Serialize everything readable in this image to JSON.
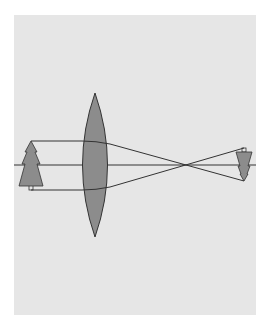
{
  "diagram": {
    "type": "converging-lens-ray-diagram",
    "colors": {
      "background": "#ffffff",
      "panel": "#e6e6e6",
      "lens_fill": "#8c8c8c",
      "object_fill": "#8c8c8c",
      "line": "#333333"
    },
    "elements": [
      {
        "name": "optical-axis"
      },
      {
        "name": "convex-lens"
      },
      {
        "name": "object-tree",
        "orientation": "upright"
      },
      {
        "name": "image-tree",
        "orientation": "inverted",
        "size": "diminished"
      },
      {
        "name": "focal-crossing-point"
      }
    ]
  }
}
